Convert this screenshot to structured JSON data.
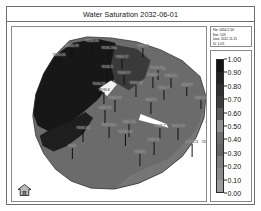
{
  "window": {
    "title": "Water Saturation 2032-06-01"
  },
  "info_box": {
    "lines": [
      "File: 0454-2.50:",
      "Stor: 103",
      "Date: 2012-11-15",
      "ID: 1.0/1"
    ]
  },
  "colorbar": {
    "title": "Water Saturation",
    "min": 0.0,
    "max": 1.0,
    "step": 0.1,
    "orientation": "vertical",
    "ticks": [
      "1.00",
      "0.90",
      "0.80",
      "0.70",
      "0.60",
      "0.50",
      "0.40",
      "0.30",
      "0.20",
      "0.10",
      "0.00"
    ],
    "band_colors": [
      "#141414",
      "#222222",
      "#303030",
      "#3e3e3e",
      "#5a5a5a",
      "#8e8e8e",
      "#6e6e6e",
      "#646464",
      "#7c7c7c",
      "#8a8a8a",
      "#9a9a9a"
    ]
  },
  "map": {
    "background_color": "#ffffff",
    "high_sat_color": "#171717",
    "mid_sat_color": "#6b6b6b",
    "low_sat_color": "#8f8f8f",
    "channel_color": "#f2f2f2",
    "outline_color": "#2a2a2a"
  },
  "toolbar": {
    "home_label": "home-icon"
  },
  "chart_data": {
    "type": "heatmap",
    "title": "Water Saturation 2032-06-01",
    "xlabel": "",
    "ylabel": "",
    "legend_position": "right",
    "grid": false,
    "colorbar_range": [
      0.0,
      1.0
    ],
    "colorbar_ticks": [
      1.0,
      0.9,
      0.8,
      0.7,
      0.6,
      0.5,
      0.4,
      0.3,
      0.2,
      0.1,
      0.0
    ],
    "wells": [
      {
        "name": "YD34-38",
        "x": 80,
        "y": 13,
        "stem": 14,
        "align": "center"
      },
      {
        "name": "YD34-28",
        "x": 60,
        "y": 18,
        "stem": 11,
        "align": "center"
      },
      {
        "name": "YD34-19w",
        "x": 97,
        "y": 20,
        "stem": 9,
        "align": "center"
      },
      {
        "name": "YD34-7",
        "x": 131,
        "y": 18,
        "stem": 9,
        "align": "center"
      },
      {
        "name": "YD34-35",
        "x": 47,
        "y": 27,
        "stem": 10,
        "align": "center"
      },
      {
        "name": "YD34-17",
        "x": 110,
        "y": 29,
        "stem": 10,
        "align": "center"
      },
      {
        "name": "YD34-50g",
        "x": 146,
        "y": 40,
        "stem": 10,
        "align": "center"
      },
      {
        "name": "YD34-3",
        "x": 95,
        "y": 39,
        "stem": 11,
        "align": "center"
      },
      {
        "name": "YD33-12",
        "x": 112,
        "y": 45,
        "stem": 10,
        "align": "center"
      },
      {
        "name": "YD34-2L",
        "x": 159,
        "y": 48,
        "stem": 10,
        "align": "center"
      },
      {
        "name": "YD33-9",
        "x": 141,
        "y": 47,
        "stem": 11,
        "align": "center"
      },
      {
        "name": "YD34-21",
        "x": 87,
        "y": 56,
        "stem": 12,
        "align": "center"
      },
      {
        "name": "YD34-33",
        "x": 124,
        "y": 55,
        "stem": 12,
        "align": "center"
      },
      {
        "name": "YD34-V",
        "x": 175,
        "y": 57,
        "stem": 9,
        "align": "center"
      },
      {
        "name": "YD34-7",
        "x": 152,
        "y": 60,
        "stem": 10,
        "align": "center"
      },
      {
        "name": "YD33-8",
        "x": 92,
        "y": 62,
        "stem": 12,
        "align": "center"
      },
      {
        "name": "YD34-20",
        "x": 103,
        "y": 70,
        "stem": 12,
        "align": "center"
      },
      {
        "name": "YD34-33",
        "x": 189,
        "y": 70,
        "stem": 9,
        "align": "center"
      },
      {
        "name": "YD34-5",
        "x": 139,
        "y": 72,
        "stem": 12,
        "align": "center"
      },
      {
        "name": "YD1760",
        "x": 206,
        "y": 81,
        "stem": 8,
        "align": "center"
      },
      {
        "name": "YD34-22",
        "x": 93,
        "y": 80,
        "stem": 13,
        "align": "center"
      },
      {
        "name": "YD33-5K",
        "x": 200,
        "y": 95,
        "stem": 9,
        "align": "center"
      },
      {
        "name": "YD34-38",
        "x": 117,
        "y": 94,
        "stem": 13,
        "align": "center"
      },
      {
        "name": "YD33-15a",
        "x": 97,
        "y": 97,
        "stem": 11,
        "align": "center"
      },
      {
        "name": "YD33-7",
        "x": 148,
        "y": 98,
        "stem": 12,
        "align": "center"
      },
      {
        "name": "YD32-19",
        "x": 166,
        "y": 98,
        "stem": 12,
        "align": "center"
      },
      {
        "name": "YD3-PG4",
        "x": 113,
        "y": 104,
        "stem": 12,
        "align": "center"
      },
      {
        "name": "YD2",
        "x": 215,
        "y": 108,
        "stem": 7,
        "align": "center"
      },
      {
        "name": "YD34-18",
        "x": 71,
        "y": 100,
        "stem": 12,
        "align": "center"
      },
      {
        "name": "YD34-11",
        "x": 142,
        "y": 112,
        "stem": 13,
        "align": "center"
      },
      {
        "name": "YD33-11",
        "x": 180,
        "y": 114,
        "stem": 13,
        "align": "center"
      },
      {
        "name": "YD34-71",
        "x": 196,
        "y": 114,
        "stem": 13,
        "align": "center"
      },
      {
        "name": "YD31",
        "x": 60,
        "y": 118,
        "stem": 11,
        "align": "center"
      },
      {
        "name": "YD33-6",
        "x": 128,
        "y": 124,
        "stem": 12,
        "align": "center"
      }
    ]
  }
}
